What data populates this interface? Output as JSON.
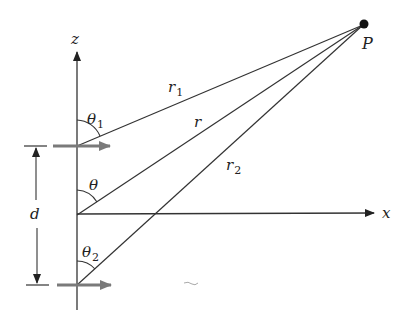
{
  "diagram": {
    "title": "",
    "labels": {
      "z_axis": "z",
      "x_axis": "x",
      "point": "P",
      "r1": "r",
      "r1_sub": "1",
      "r": "r",
      "r2": "r",
      "r2_sub": "2",
      "theta1": "θ",
      "theta1_sub": "1",
      "theta": "θ",
      "theta2": "θ",
      "theta2_sub": "2",
      "separation": "d"
    },
    "colors": {
      "line": "#333333",
      "dipole_arrow": "#7a7a7a",
      "point": "#111111"
    }
  }
}
